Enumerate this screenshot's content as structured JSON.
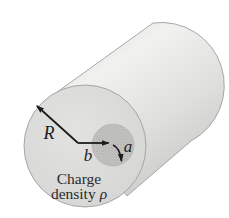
{
  "figure": {
    "labels": {
      "outer_radius": "R",
      "offset": "b",
      "inner_radius": "a",
      "caption_line1": "Charge",
      "caption_line2_word": "density",
      "caption_rho": "ρ"
    },
    "colors": {
      "background": "#ffffff",
      "body_light": "#f1f1ef",
      "body_mid": "#dededc",
      "body_dark": "#c3c3c1",
      "face_light": "#e2e2e0",
      "face_dark": "#d3d3d1",
      "edge": "#9e9e9c",
      "cavity_base": "#c4c4c2",
      "cavity_dot": "#a4a4a2",
      "cavity_edge": "#b0b0ae",
      "arrow": "#1c1c1c",
      "text": "#2a2a2a"
    }
  }
}
